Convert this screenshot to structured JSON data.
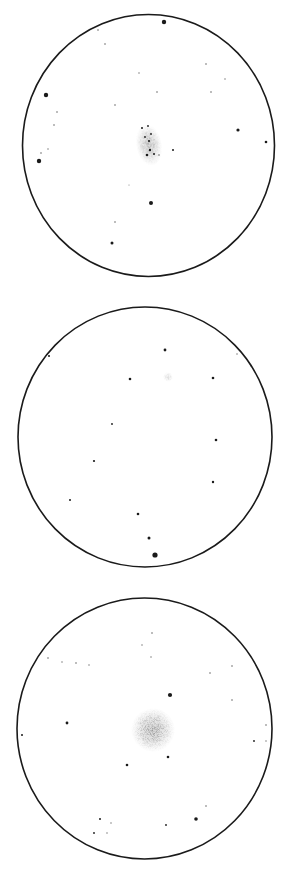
{
  "background": "#ffffff",
  "ink_color": "#1a1a1a",
  "nebula_color": "#555555",
  "fields": [
    {
      "name": "field-1",
      "circle": {
        "cx": 148.5,
        "cy": 145.5,
        "rx": 126,
        "ry": 131
      },
      "nebula": {
        "cx": 149,
        "cy": 145,
        "rx": 13,
        "ry": 21,
        "density": 0.85,
        "rotate": -10
      },
      "stars": [
        [
          164,
          22,
          2.2
        ],
        [
          98,
          30,
          0.8
        ],
        [
          105,
          44,
          0.8
        ],
        [
          206,
          64,
          0.8
        ],
        [
          225,
          79,
          0.7
        ],
        [
          139,
          73,
          0.7
        ],
        [
          157,
          92,
          0.8
        ],
        [
          211,
          92,
          0.8
        ],
        [
          115,
          105,
          0.8
        ],
        [
          46,
          95,
          2.2
        ],
        [
          57,
          112,
          0.8
        ],
        [
          54,
          125,
          0.8
        ],
        [
          41,
          153,
          0.8
        ],
        [
          48,
          149,
          0.7
        ],
        [
          39,
          161,
          2.2
        ],
        [
          238,
          130,
          1.6
        ],
        [
          266,
          142,
          1.3
        ],
        [
          173,
          150,
          1.0
        ],
        [
          151,
          203,
          2.0
        ],
        [
          129,
          185,
          0.5
        ],
        [
          115,
          222,
          0.8
        ],
        [
          112,
          243,
          1.5
        ],
        [
          142,
          128,
          1.0
        ],
        [
          148,
          126,
          0.9
        ],
        [
          145,
          137,
          0.9
        ],
        [
          151,
          134,
          0.9
        ],
        [
          149,
          141,
          1.1
        ],
        [
          150,
          150,
          1.2
        ],
        [
          147,
          155,
          1.3
        ],
        [
          154,
          154,
          1.0
        ],
        [
          159,
          155,
          0.8
        ]
      ]
    },
    {
      "name": "field-2",
      "circle": {
        "cx": 145,
        "cy": 437,
        "rx": 127,
        "ry": 130
      },
      "nebula": {
        "cx": 168,
        "cy": 377,
        "rx": 5,
        "ry": 5,
        "density": 0.35,
        "rotate": 0
      },
      "stars": [
        [
          49,
          356,
          1.0
        ],
        [
          165,
          350,
          1.4
        ],
        [
          237,
          354,
          0.7
        ],
        [
          251,
          366,
          0.6
        ],
        [
          130,
          379,
          1.3
        ],
        [
          213,
          378,
          1.3
        ],
        [
          112,
          424,
          0.9
        ],
        [
          216,
          440,
          1.3
        ],
        [
          94,
          461,
          1.1
        ],
        [
          213,
          482,
          1.2
        ],
        [
          70,
          500,
          1.0
        ],
        [
          138,
          514,
          1.3
        ],
        [
          149,
          538,
          1.5
        ],
        [
          155,
          555,
          2.6
        ]
      ]
    },
    {
      "name": "field-3",
      "circle": {
        "cx": 144.5,
        "cy": 728.5,
        "rx": 127.5,
        "ry": 130.5
      },
      "nebula": {
        "cx": 153,
        "cy": 730,
        "rx": 22,
        "ry": 22,
        "density": 1.0,
        "rotate": 0
      },
      "stars": [
        [
          152,
          633,
          0.8
        ],
        [
          142,
          645,
          0.7
        ],
        [
          151,
          657,
          0.7
        ],
        [
          48,
          658,
          0.8
        ],
        [
          62,
          662,
          0.7
        ],
        [
          76,
          663,
          0.8
        ],
        [
          89,
          665,
          0.7
        ],
        [
          210,
          673,
          0.8
        ],
        [
          232,
          666,
          0.8
        ],
        [
          170,
          695,
          2.1
        ],
        [
          232,
          700,
          0.8
        ],
        [
          67,
          723,
          1.4
        ],
        [
          22,
          735,
          1.0
        ],
        [
          266,
          725,
          0.8
        ],
        [
          254,
          741,
          0.9
        ],
        [
          266,
          741,
          0.7
        ],
        [
          168,
          757,
          1.3
        ],
        [
          127,
          765,
          1.3
        ],
        [
          206,
          806,
          0.8
        ],
        [
          100,
          819,
          1.0
        ],
        [
          111,
          823,
          0.7
        ],
        [
          94,
          833,
          0.9
        ],
        [
          107,
          833,
          0.7
        ],
        [
          166,
          825,
          0.9
        ],
        [
          196,
          819,
          1.8
        ]
      ]
    }
  ]
}
